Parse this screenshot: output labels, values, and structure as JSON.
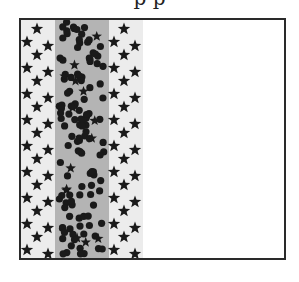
{
  "diagram": {
    "title_fragment": "p p",
    "frame": {
      "left": 19,
      "top": 18,
      "width": 263,
      "height": 238,
      "border_color": "#2a2a2a"
    },
    "bands": [
      {
        "name": "left-star-band",
        "x0": 0,
        "x1": 34,
        "fill": "#ececec",
        "marker": "star"
      },
      {
        "name": "center-dot-band",
        "x0": 34,
        "x1": 88,
        "fill": "#b4b4b4",
        "marker": "dot"
      },
      {
        "name": "right-star-band",
        "x0": 88,
        "x1": 122,
        "fill": "#ececec",
        "marker": "star"
      },
      {
        "name": "empty-region",
        "x0": 122,
        "x1": 263,
        "fill": "#ffffff",
        "marker": "none"
      }
    ],
    "marker_color": "#1a1a1a"
  }
}
